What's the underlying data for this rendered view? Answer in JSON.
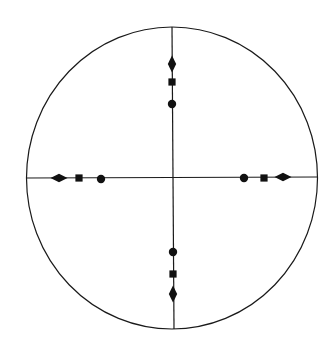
{
  "diagram": {
    "type": "stereographic-projection",
    "background": "#ffffff",
    "stroke_color": "#1a1a1a",
    "fill_color": "#111111",
    "primitive_circle": {
      "cx": 172,
      "cy": 178,
      "rx": 145.5,
      "ry": 151
    },
    "axes": {
      "vertical": {
        "x1": 172,
        "y1": 27,
        "x2": 174,
        "y2": 329
      },
      "horizontal": {
        "x1": 26,
        "y1": 178,
        "x2": 317,
        "y2": 177
      }
    },
    "poles": [
      {
        "id": "north-diamond",
        "shape": "diamond",
        "x": 172,
        "y": 64,
        "orient": "vertical"
      },
      {
        "id": "north-square",
        "shape": "square",
        "x": 172,
        "y": 82
      },
      {
        "id": "north-circle",
        "shape": "circle",
        "x": 172,
        "y": 104
      },
      {
        "id": "south-circle",
        "shape": "circle",
        "x": 173,
        "y": 252
      },
      {
        "id": "south-square",
        "shape": "square",
        "x": 173,
        "y": 274
      },
      {
        "id": "south-diamond",
        "shape": "diamond",
        "x": 173,
        "y": 294,
        "orient": "vertical"
      },
      {
        "id": "west-diamond",
        "shape": "diamond",
        "x": 59,
        "y": 178,
        "orient": "horizontal"
      },
      {
        "id": "west-square",
        "shape": "square",
        "x": 79,
        "y": 178
      },
      {
        "id": "west-circle",
        "shape": "circle",
        "x": 101,
        "y": 179
      },
      {
        "id": "east-circle",
        "shape": "circle",
        "x": 244,
        "y": 178
      },
      {
        "id": "east-square",
        "shape": "square",
        "x": 264,
        "y": 178
      },
      {
        "id": "east-diamond",
        "shape": "diamond",
        "x": 283,
        "y": 177,
        "orient": "horizontal"
      }
    ],
    "legend": {
      "diamond": "2-fold symmetry pole",
      "square": "4-fold symmetry pole",
      "circle": "pole"
    }
  }
}
